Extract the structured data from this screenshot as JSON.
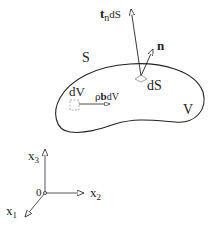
{
  "diagram": {
    "labels": {
      "traction": "t",
      "traction_sub": "n",
      "traction_suffix": "dS",
      "normal": "n",
      "surface": "S",
      "surface_element": "dS",
      "volume": "V",
      "volume_element": "dV",
      "body_force_rho": "ρ",
      "body_force_b": "b",
      "body_force_suffix": "dV",
      "axis_x3": "x",
      "axis_x3_sub": "3",
      "axis_x2": "x",
      "axis_x2_sub": "2",
      "axis_x1": "x",
      "axis_x1_sub": "1",
      "origin": "0"
    },
    "colors": {
      "stroke": "#222222",
      "dashed": "#999999"
    }
  }
}
